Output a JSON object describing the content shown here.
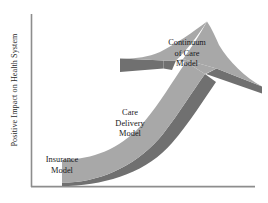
{
  "figure": {
    "type": "conceptual-arrow-diagram",
    "background_color": "#ffffff",
    "axis": {
      "color": "#8d8d8d",
      "y_axis_label": "Positive Impact on Health System",
      "x_axis_label": "",
      "y_ticks": [],
      "x_ticks": [],
      "origin_px": [
        31,
        187
      ],
      "y_top_px": 14,
      "x_right_px": 255
    },
    "arrow": {
      "face_color": "#a8a8a8",
      "shadow_color": "#707070",
      "outline_color": "#9a9a9a",
      "direction": "upward-right curving arrow with 3D side face",
      "stages": 3
    },
    "labels": [
      {
        "id": "insurance-model",
        "text": "Insurance\nModel",
        "stage": 1,
        "position_px": [
          32,
          155
        ]
      },
      {
        "id": "care-delivery-model",
        "text": "Care\nDelivery\nModel",
        "stage": 2,
        "position_px": [
          100,
          108
        ]
      },
      {
        "id": "continuum-of-care-model",
        "text": "Continuum\nof Care\nModel",
        "stage": 3,
        "position_px": [
          156,
          38
        ]
      }
    ]
  }
}
